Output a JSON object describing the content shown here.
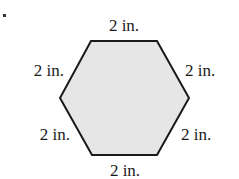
{
  "figure": {
    "shape": "regular hexagon",
    "fill_color": "#e6e6e6",
    "stroke_color": "#1a1a1a",
    "bullet": "•",
    "side_labels": {
      "top": "2 in.",
      "upper_left": "2 in.",
      "upper_right": "2 in.",
      "lower_left": "2 in.",
      "lower_right": "2 in.",
      "bottom": "2 in."
    }
  }
}
